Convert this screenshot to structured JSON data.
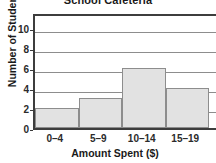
{
  "chart_data": {
    "type": "bar",
    "title": "School Cafeteria",
    "xlabel": "Amount Spent ($)",
    "ylabel": "Number of Students",
    "categories": [
      "0–4",
      "5–9",
      "10–14",
      "15–19"
    ],
    "values": [
      2,
      3,
      6,
      4
    ],
    "ylim": [
      0,
      11.6
    ],
    "yticks": [
      0,
      2,
      4,
      6,
      8,
      10
    ],
    "ytick_labels": [
      "0",
      "2",
      "4",
      "6",
      "8",
      "10"
    ],
    "grid": "horizontal",
    "legend": "none",
    "bar_style": "adjacent-histogram",
    "bar_fill_color": "#e2e2e2",
    "bar_edge_color": "#8d8d8d",
    "axis_color": "#3d3d3d",
    "gridline_color": "#8d8d8d",
    "background_color": "#ffffff",
    "text_color": "#1a1a1a",
    "note": "Rightmost bin is cropped by the image edge"
  }
}
